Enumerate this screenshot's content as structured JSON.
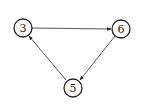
{
  "diagram": {
    "type": "directed-graph",
    "nodes": [
      {
        "id": "n3",
        "label": "3",
        "cx": 23,
        "cy": 28,
        "r": 9
      },
      {
        "id": "n6",
        "label": "6",
        "cx": 121,
        "cy": 29,
        "r": 9
      },
      {
        "id": "n5",
        "label": "5",
        "cx": 73,
        "cy": 88,
        "r": 9
      }
    ],
    "edges": [
      {
        "from": "3",
        "to": "6"
      },
      {
        "from": "6",
        "to": "5"
      },
      {
        "from": "5",
        "to": "3"
      }
    ],
    "colors": {
      "stroke": "#222222",
      "background": "#ffffff"
    }
  }
}
